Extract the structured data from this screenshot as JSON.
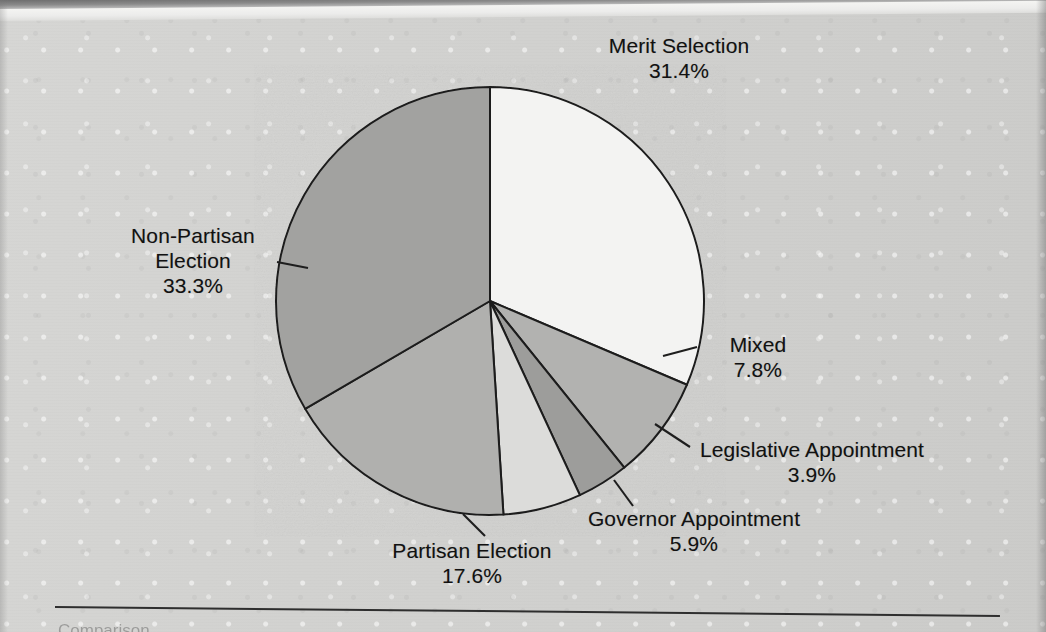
{
  "document": {
    "figure_type": "pie-chart",
    "bottom_rule": true
  },
  "chart_data": {
    "type": "pie",
    "title": "",
    "xlabel": "",
    "ylabel": "",
    "legend_position": "none",
    "grid": false,
    "units": "%",
    "start_angle_deg": 0,
    "direction": "clockwise",
    "categories": [
      "Merit Selection",
      "Mixed",
      "Legislative Appointment",
      "Governor Appointment",
      "Partisan Election",
      "Non-Partisan Election"
    ],
    "values": [
      31.4,
      7.8,
      3.9,
      5.9,
      17.6,
      33.3
    ],
    "value_labels": [
      "31.4%",
      "7.8%",
      "3.9%",
      "5.9%",
      "17.6%",
      "33.3%"
    ],
    "colors": [
      "#f3f3f2",
      "#b2b2b0",
      "#9d9d9b",
      "#dcdcda",
      "#b0b0ae",
      "#a2a2a0"
    ],
    "slices": [
      {
        "label": "Merit Selection",
        "value": 31.4,
        "value_label": "31.4%",
        "color": "#f3f3f2",
        "start_deg": 0.0,
        "end_deg": 113.04,
        "leader_line": false
      },
      {
        "label": "Mixed",
        "value": 7.8,
        "value_label": "7.8%",
        "color": "#b2b2b0",
        "start_deg": 113.04,
        "end_deg": 141.12,
        "leader_line": true
      },
      {
        "label": "Legislative Appointment",
        "value": 3.9,
        "value_label": "3.9%",
        "color": "#9d9d9b",
        "start_deg": 141.12,
        "end_deg": 155.16,
        "leader_line": true
      },
      {
        "label": "Governor Appointment",
        "value": 5.9,
        "value_label": "5.9%",
        "color": "#dcdcda",
        "start_deg": 155.16,
        "end_deg": 176.4,
        "leader_line": true
      },
      {
        "label": "Partisan Election",
        "value": 17.6,
        "value_label": "17.6%",
        "color": "#b0b0ae",
        "start_deg": 176.4,
        "end_deg": 239.76,
        "leader_line": true
      },
      {
        "label": "Non-Partisan Election",
        "value": 33.3,
        "value_label": "33.3%",
        "color": "#a2a2a0",
        "start_deg": 239.76,
        "end_deg": 360.0,
        "leader_line": true
      }
    ]
  },
  "labels": {
    "merit": {
      "name": "Merit Selection",
      "pct": "31.4%"
    },
    "mixed": {
      "name": "Mixed",
      "pct": "7.8%"
    },
    "legislative": {
      "name": "Legislative Appointment",
      "pct": "3.9%"
    },
    "governor": {
      "name": "Governor Appointment",
      "pct": "5.9%"
    },
    "partisan": {
      "name": "Partisan Election",
      "pct": "17.6%"
    },
    "nonpartisan": {
      "name": "Non-Partisan",
      "name2": "Election",
      "pct": "33.3%"
    }
  },
  "artifacts": {
    "ghost_text": "Comparison"
  }
}
